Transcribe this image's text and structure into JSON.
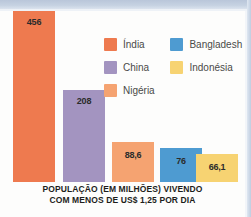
{
  "chart_data": {
    "type": "bar",
    "title": "POPULAÇÃO (EM MILHÕES) VIVENDO COM MENOS DE US$ 1,25 POR DIA",
    "xlabel": "",
    "ylabel": "População (em milhões)",
    "grid": false,
    "legend_position": "top-right",
    "categories": [
      "Índia",
      "China",
      "Nigéria",
      "Bangladesh",
      "Indonésia"
    ],
    "values": [
      456,
      208,
      88.6,
      76,
      66.1
    ],
    "value_labels": [
      "456",
      "208",
      "88,6",
      "76",
      "66,1"
    ],
    "colors": [
      "#ee7a4f",
      "#a394c0",
      "#f5a371",
      "#4e9bd1",
      "#f7d372"
    ],
    "ylim": [
      0,
      480
    ]
  },
  "caption": {
    "line1": "POPULAÇÃO (EM MILHÕES) VIVENDO",
    "line2": "COM MENOS DE US$ 1,25 POR DIA"
  },
  "legend": {
    "items": [
      {
        "label": "Índia",
        "color": "#ee7a4f"
      },
      {
        "label": "Bangladesh",
        "color": "#4e9bd1"
      },
      {
        "label": "China",
        "color": "#a394c0"
      },
      {
        "label": "Indonésia",
        "color": "#f7d372"
      },
      {
        "label": "Nigéria",
        "color": "#f5a371"
      }
    ]
  },
  "bars": [
    {
      "label": "Índia",
      "value_label": "456",
      "color": "#ee7a4f",
      "left": 13,
      "width": 42,
      "height": 171
    },
    {
      "label": "China",
      "value_label": "208",
      "color": "#a394c0",
      "left": 63,
      "width": 42,
      "height": 92
    },
    {
      "label": "Nigéria",
      "value_label": "88,6",
      "color": "#f5a371",
      "left": 112,
      "width": 42,
      "height": 40
    },
    {
      "label": "Bangladesh",
      "value_label": "76",
      "color": "#4e9bd1",
      "left": 160,
      "width": 42,
      "height": 34
    },
    {
      "label": "Indonésia",
      "value_label": "66,1",
      "color": "#f7d372",
      "left": 196,
      "width": 42,
      "height": 28
    }
  ]
}
